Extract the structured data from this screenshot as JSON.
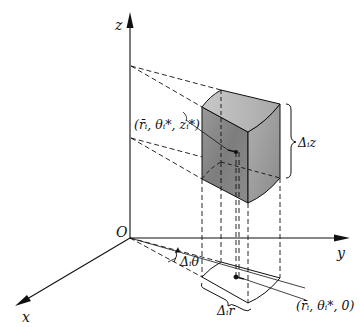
{
  "diagram": {
    "type": "3d-cylindrical-volume-element",
    "axes": {
      "z_label": "z",
      "y_label": "y",
      "x_label": "x",
      "origin_label": "O"
    },
    "labels": {
      "point_top": "(r̄ᵢ, θᵢ*, zᵢ*)",
      "point_base": "(r̄ᵢ, θᵢ*, 0)",
      "delta_z": "Δᵢz",
      "delta_r": "Δᵢr",
      "delta_theta": "Δᵢθ"
    },
    "colors": {
      "line": "#111111",
      "solid_top": "#bdbdbd",
      "solid_front": "#8f8f8f",
      "solid_side": "#a6a6a6"
    }
  }
}
